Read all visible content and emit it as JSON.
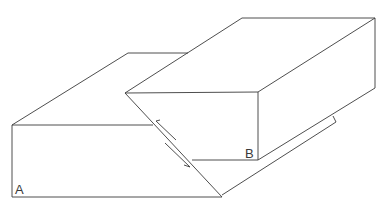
{
  "diagram": {
    "type": "fault-block-diagram",
    "labels": {
      "a": "A",
      "b": "B"
    },
    "line_color": "#3a3a3a",
    "background": "#ffffff"
  }
}
